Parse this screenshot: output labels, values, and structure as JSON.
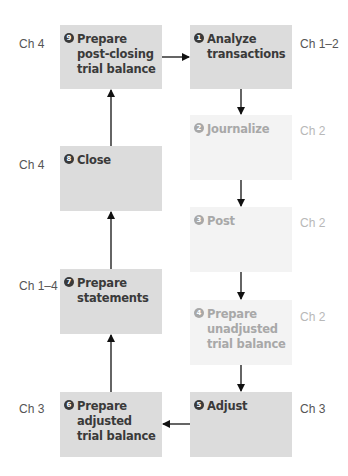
{
  "diagram": {
    "steps": [
      {
        "number": "1",
        "label": "Analyze\ntransactions",
        "chapter": "Ch 1–2",
        "faded": false
      },
      {
        "number": "2",
        "label": "Journalize",
        "chapter": "Ch 2",
        "faded": true
      },
      {
        "number": "3",
        "label": "Post",
        "chapter": "Ch 2",
        "faded": true
      },
      {
        "number": "4",
        "label": "Prepare\nunadjusted\ntrial balance",
        "chapter": "Ch 2",
        "faded": true
      },
      {
        "number": "5",
        "label": "Adjust",
        "chapter": "Ch 3",
        "faded": false
      },
      {
        "number": "6",
        "label": "Prepare\nadjusted\ntrial balance",
        "chapter": "Ch 3",
        "faded": false
      },
      {
        "number": "7",
        "label": "Prepare\nstatements",
        "chapter": "Ch 1–4",
        "faded": false
      },
      {
        "number": "8",
        "label": "Close",
        "chapter": "Ch 4",
        "faded": false
      },
      {
        "number": "9",
        "label": "Prepare\npost-closing\ntrial balance",
        "chapter": "Ch 4",
        "faded": false
      }
    ],
    "flow": [
      {
        "from": "9",
        "to": "1"
      },
      {
        "from": "1",
        "to": "2"
      },
      {
        "from": "2",
        "to": "3"
      },
      {
        "from": "3",
        "to": "4"
      },
      {
        "from": "4",
        "to": "5"
      },
      {
        "from": "5",
        "to": "6"
      },
      {
        "from": "6",
        "to": "7"
      },
      {
        "from": "7",
        "to": "8"
      },
      {
        "from": "8",
        "to": "9"
      }
    ]
  }
}
